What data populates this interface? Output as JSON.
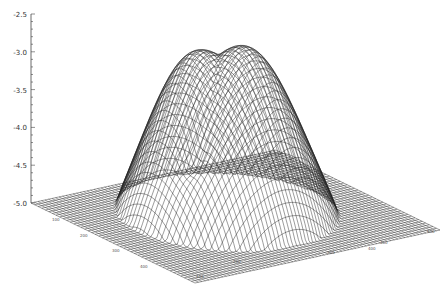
{
  "chart_data": {
    "type": "surface",
    "title": "",
    "xlabel": "",
    "ylabel": "",
    "zlabel": "",
    "z_axis": {
      "range": [
        -5.0,
        -2.5
      ],
      "ticks": [
        -2.5,
        -3.0,
        -3.5,
        -4.0,
        -4.5,
        -5.0
      ],
      "tick_labels": [
        "-2.5",
        "-3.0",
        "-3.5",
        "-4.0",
        "-4.5",
        "-5.0"
      ],
      "minor_ticks_per_major": 4
    },
    "x_axis": {
      "tick_labels": [
        "100",
        "200",
        "300",
        "400",
        "500"
      ],
      "note": "tick labels along front-right floor edge are illegible at this resolution; values approximate"
    },
    "y_axis": {
      "tick_labels": [
        "100",
        "200",
        "300",
        "400"
      ],
      "note": "tick labels along front-left floor edge are illegible at this resolution; values approximate"
    },
    "surface": {
      "floor": -5.0,
      "peaks": [
        {
          "name": "left-peak",
          "z": -2.68
        },
        {
          "name": "right-peak",
          "z": -2.92
        }
      ],
      "dimple": {
        "z": -3.9
      }
    },
    "grid": false,
    "legend": null,
    "style": {
      "line_color": "#222222",
      "background": "#ffffff"
    }
  }
}
